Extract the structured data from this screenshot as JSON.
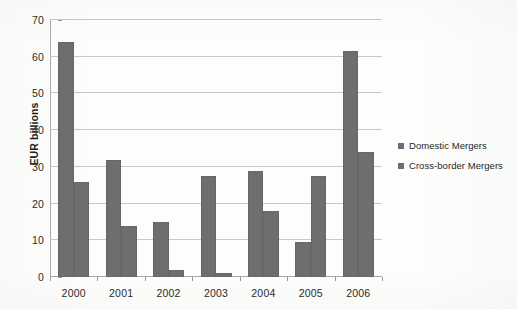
{
  "chart_data": {
    "type": "bar",
    "title": "",
    "subtitle": "",
    "xlabel": "",
    "ylabel": "EUR billions",
    "ylim": [
      0,
      70
    ],
    "ytick_labels": [
      "0",
      "10",
      "20",
      "30",
      "40",
      "50",
      "60",
      "70"
    ],
    "yticks": [
      0,
      10,
      20,
      30,
      40,
      50,
      60,
      70
    ],
    "grid": true,
    "legend_position": "right",
    "categories": [
      "2000",
      "2001",
      "2002",
      "2003",
      "2004",
      "2005",
      "2006"
    ],
    "series": [
      {
        "name": "Domestic Mergers",
        "color": "#6e6e6e",
        "values": [
          64,
          32,
          15,
          27.5,
          29,
          9.5,
          61.5
        ]
      },
      {
        "name": "Cross-border Mergers",
        "color": "#6e6e6e",
        "values": [
          26,
          14,
          2,
          1,
          18,
          27.5,
          34
        ]
      }
    ]
  },
  "legend": {
    "items": [
      {
        "label": "Domestic Mergers",
        "color": "#6e6e6e"
      },
      {
        "label": "Cross-border Mergers",
        "color": "#6e6e6e"
      }
    ]
  },
  "axes": {
    "y_title": "EUR billions"
  },
  "colors": {
    "bar": "#6e6e6e",
    "gridline": "#c9c9c9",
    "axis": "#a9a9a9",
    "text": "#2b2b2b",
    "background": "#fdfdfc"
  }
}
